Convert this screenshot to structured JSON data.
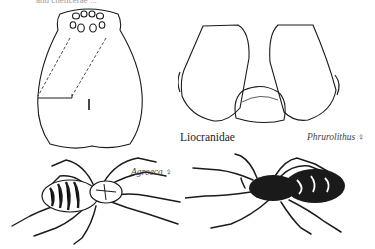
{
  "page": {
    "top_cut_text": "and chelicerae ...",
    "family_label": "Liocranidae",
    "figures": [
      {
        "id": "carapace",
        "description": "Carapace, dorsal view, with eye group and dashed construction lines"
      },
      {
        "id": "chelicerae",
        "description": "Chelicerae, frontal view"
      },
      {
        "id": "agroeca",
        "genus": "Agroeca",
        "sex": "♀",
        "label": "Agroeca ♀"
      },
      {
        "id": "phrurolithus",
        "genus": "Phrurolithus",
        "sex": "♀",
        "label": "Phrurolithus ♀"
      }
    ]
  },
  "colors": {
    "ink": "#1a1a1a",
    "paper": "#ffffff"
  }
}
